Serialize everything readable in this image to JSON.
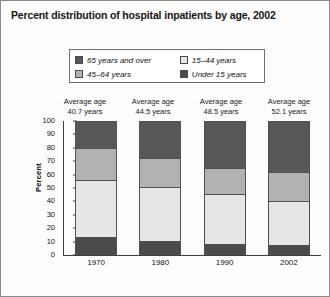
{
  "title": "Percent distribution of hospital inpatients by age, 2002",
  "legend": {
    "items": [
      {
        "label": "65 years and over",
        "color": "#58585a"
      },
      {
        "label": "15–44 years",
        "color": "#e6e6e6"
      },
      {
        "label": "45–64 years",
        "color": "#b2b2b2"
      },
      {
        "label": "Under 15 years",
        "color": "#4a4a4a"
      }
    ]
  },
  "averages": [
    {
      "line1": "Average age",
      "line2": "40.7 years"
    },
    {
      "line1": "Average age",
      "line2": "44.5 years"
    },
    {
      "line1": "Average age",
      "line2": "48.5 years"
    },
    {
      "line1": "Average age",
      "line2": "52.1 years"
    }
  ],
  "chart_data": {
    "type": "bar",
    "title": "Percent distribution of hospital inpatients by age, 2002",
    "xlabel": "",
    "ylabel": "Percent",
    "ylim": [
      0,
      100
    ],
    "ytick_labels": [
      "100",
      "90",
      "80",
      "70",
      "60",
      "50",
      "40",
      "30",
      "20",
      "10",
      "0"
    ],
    "ytick_values": [
      100,
      90,
      80,
      70,
      60,
      50,
      40,
      30,
      20,
      10,
      0
    ],
    "grid": false,
    "stacked": true,
    "legend_position": "top",
    "categories": [
      "1970",
      "1980",
      "1990",
      "2002"
    ],
    "series": [
      {
        "name": "65 years and over",
        "color": "#58585a",
        "values": [
          20,
          27,
          34.5,
          38
        ]
      },
      {
        "name": "45–64 years",
        "color": "#b2b2b2",
        "values": [
          24,
          22,
          20,
          22
        ]
      },
      {
        "name": "15–44 years",
        "color": "#e6e6e6",
        "values": [
          43,
          41,
          38,
          33
        ]
      },
      {
        "name": "Under 15 years",
        "color": "#4a4a4a",
        "values": [
          13,
          10,
          7.5,
          7
        ]
      }
    ],
    "annotations": [
      "Average age 40.7 years",
      "Average age 44.5 years",
      "Average age 48.5 years",
      "Average age 52.1 years"
    ]
  }
}
